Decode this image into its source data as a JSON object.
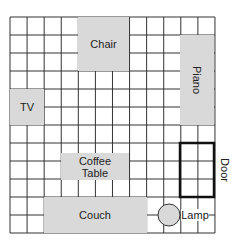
{
  "room": {
    "x0": 10,
    "y0": 17,
    "cols": 12,
    "rows": 12,
    "cell_w": 17.08,
    "cell_h": 18
  },
  "colors": {
    "grid": "#333333",
    "furniture": "#d9d9d9",
    "door": "#111111"
  },
  "furniture": {
    "chair": {
      "label": "Chair"
    },
    "tv": {
      "label": "TV"
    },
    "piano": {
      "label": "Piano"
    },
    "coffee_table": {
      "label1": "Coffee",
      "label2": "Table"
    },
    "couch": {
      "label": "Couch"
    },
    "lamp": {
      "label": "Lamp"
    },
    "door": {
      "label": "Door"
    }
  }
}
